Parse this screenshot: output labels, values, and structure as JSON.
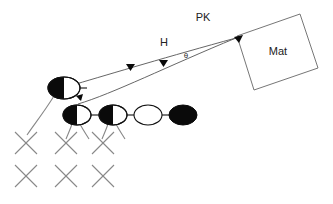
{
  "canvas": {
    "width": 333,
    "height": 204,
    "background": "#ffffff"
  },
  "labels": {
    "pk": "PK",
    "h": "H",
    "theta": "θ",
    "mat": "Mat"
  },
  "colors": {
    "ink": "#0a0a0a",
    "line": "#555555",
    "box_line": "#666666",
    "x_mark": "#888888",
    "text": "#222222",
    "background": "#ffffff"
  },
  "mat_box": {
    "label": "Mat",
    "corners": [
      [
        237,
        36
      ],
      [
        300,
        14
      ],
      [
        318,
        68
      ],
      [
        254,
        90
      ]
    ],
    "label_x": 278,
    "label_y": 52
  },
  "ellipses": {
    "top_row": [
      {
        "name": "ellipse-top-left",
        "cx": 64,
        "cy": 88,
        "rx": 16,
        "ry": 11,
        "fill": "half-left"
      }
    ],
    "bottom_row": [
      {
        "name": "ellipse-bottom-1",
        "cx": 77,
        "cy": 115,
        "rx": 14,
        "ry": 10,
        "fill": "half-left"
      },
      {
        "name": "ellipse-bottom-2",
        "cx": 113,
        "cy": 115,
        "rx": 14,
        "ry": 10,
        "fill": "half-left"
      },
      {
        "name": "ellipse-bottom-3",
        "cx": 148,
        "cy": 115,
        "rx": 14,
        "ry": 10,
        "fill": "none"
      },
      {
        "name": "ellipse-bottom-4",
        "cx": 183,
        "cy": 115,
        "rx": 14,
        "ry": 10,
        "fill": "solid"
      }
    ]
  },
  "connectors": [
    {
      "name": "connector-1-2",
      "x1": 91,
      "y1": 115,
      "x2": 99,
      "y2": 115
    },
    {
      "name": "connector-2-3",
      "x1": 127,
      "y1": 115,
      "x2": 134,
      "y2": 115
    },
    {
      "name": "connector-3-4",
      "x1": 162,
      "y1": 115,
      "x2": 169,
      "y2": 115
    }
  ],
  "trajectories": [
    {
      "name": "trajectory-upper",
      "path": "M 76 84 C 110 74, 170 56, 236 38",
      "arrow_at": [
        130,
        68
      ],
      "arrow_rot": 342
    },
    {
      "name": "trajectory-lower",
      "path": "M 78 104 C 110 92, 165 66, 236 38",
      "arrow_at": [
        163,
        64
      ],
      "arrow_rot": 338
    }
  ],
  "arrowheads": [
    {
      "name": "arrowhead-upper-mid",
      "x": 130,
      "y": 68
    },
    {
      "name": "arrowhead-lower-mid",
      "x": 163,
      "y": 64
    },
    {
      "name": "arrowhead-mat-entry",
      "x": 239,
      "y": 40
    },
    {
      "name": "arrowhead-drop",
      "x": 80,
      "y": 99
    }
  ],
  "drop_lines": [
    {
      "name": "drop-line-left",
      "path": "M 56 95 C 44 112, 36 122, 26 136"
    },
    {
      "name": "drop-line-1",
      "path": "M 74 124 C 71 131, 68 136, 66 142"
    },
    {
      "name": "drop-line-2",
      "path": "M 110 124 C 107 131, 104 136, 102 142"
    },
    {
      "name": "drop-line-1b",
      "path": "M 80 124 C 84 131, 88 136, 92 142"
    },
    {
      "name": "drop-line-2b",
      "path": "M 116 124 C 120 131, 124 136, 128 142"
    }
  ],
  "x_marks": {
    "size": 11,
    "columns": [
      26,
      66,
      103
    ],
    "rows": [
      143,
      175
    ]
  },
  "text_positions": {
    "pk": {
      "x": 203,
      "y": 18
    },
    "h": {
      "x": 164,
      "y": 43
    },
    "theta": {
      "x": 186,
      "y": 56
    }
  }
}
